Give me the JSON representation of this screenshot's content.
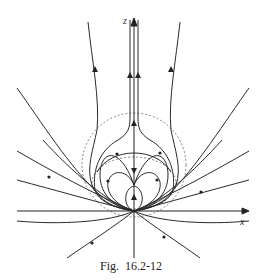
{
  "figure": {
    "caption": "Fig.  16.2-12",
    "axes": {
      "vertical_label": "z",
      "horizontal_label": "x"
    },
    "colors": {
      "line": "#2a2a2a",
      "dashed": "#555555",
      "background": "#ffffff"
    },
    "elements": {
      "field_lines": "streamlines emanating from origin with arrow markers",
      "dashed_circles": 2,
      "singular_point": "origin"
    }
  }
}
